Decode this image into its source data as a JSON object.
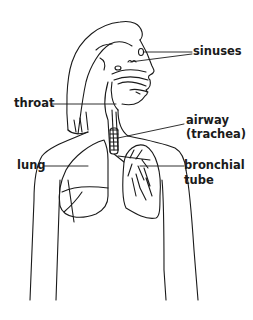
{
  "diagram": {
    "type": "anatomical-line-drawing",
    "colors": {
      "line": "#1a1a1a",
      "background": "#ffffff"
    },
    "labels": {
      "sinuses": "sinuses",
      "throat": "throat",
      "airway_line1": "airway",
      "airway_line2": "(trachea)",
      "lung": "lung",
      "bronchial_line1": "bronchial",
      "bronchial_line2": "tube"
    }
  }
}
